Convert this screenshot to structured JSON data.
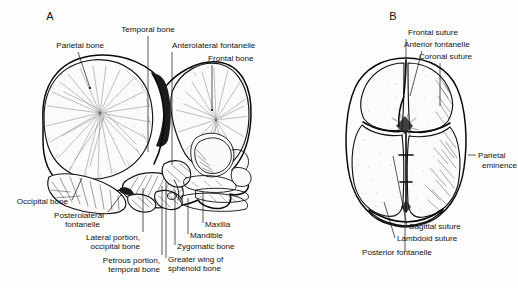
{
  "figure": {
    "background": "#fdfdfd",
    "ink": "#111111"
  },
  "panels": [
    {
      "id": "A",
      "letter": "A",
      "view": "lateral",
      "letter_pos": {
        "x": 50,
        "y": 20
      },
      "labels": [
        {
          "name": "parietal-bone",
          "text": "Parietal bone",
          "text_anchor": "end",
          "x": 104,
          "y": 48,
          "leader": "M 78 52 L 90 88"
        },
        {
          "name": "temporal-bone",
          "text": "Temporal bone",
          "text_anchor": "middle",
          "x": 148,
          "y": 32,
          "leader": "M 148 36 L 148 152"
        },
        {
          "name": "anterolateral-fontanelle",
          "text": "Anterolateral fontanelle",
          "text_anchor": "start",
          "x": 172,
          "y": 48,
          "leader": "M 172 52 L 172 165"
        },
        {
          "name": "frontal-bone",
          "text": "Frontal bone",
          "text_anchor": "start",
          "x": 208,
          "y": 61,
          "leader": "M 212 65 L 212 110"
        },
        {
          "name": "occipital-bone",
          "text": "Occipital bone",
          "text_anchor": "end",
          "x": 68,
          "y": 204,
          "leader": "M 72 200 L 82 178"
        },
        {
          "name": "posterolateral-fontanelle",
          "text": "Posterolateral",
          "text2": "fontanelle",
          "text_anchor": "end",
          "x": 104,
          "y": 218,
          "leader": "M 108 212 L 121 195"
        },
        {
          "name": "lateral-portion-occipital-bone",
          "text": "Lateral portion,",
          "text2": "occipital bone",
          "text_anchor": "end",
          "x": 140,
          "y": 240,
          "leader": "M 143 232 L 143 188"
        },
        {
          "name": "petrous-portion-temporal-bone",
          "text": "Petrous portion,",
          "text2": "temporal bone",
          "text_anchor": "end",
          "x": 160,
          "y": 263,
          "leader": "M 162 255 L 162 186"
        },
        {
          "name": "maxilla",
          "text": "Maxilla",
          "text_anchor": "start",
          "x": 205,
          "y": 227,
          "leader": "M 203 223 L 203 192"
        },
        {
          "name": "mandible",
          "text": "Mandible",
          "text_anchor": "start",
          "x": 190,
          "y": 238,
          "leader": "M 188 234 L 188 196"
        },
        {
          "name": "zygomatic-bone",
          "text": "Zygomatic bone",
          "text_anchor": "start",
          "x": 177,
          "y": 249,
          "leader": "M 175 245 L 175 190"
        },
        {
          "name": "greater-wing-of-sphenoid-bone",
          "text": "Greater wing of",
          "text2": "sphenoid bone",
          "text_anchor": "start",
          "x": 168,
          "y": 262,
          "leader": "M 166 258 L 166 182"
        }
      ]
    },
    {
      "id": "B",
      "letter": "B",
      "view": "superior",
      "letter_pos": {
        "x": 393,
        "y": 20
      },
      "labels": [
        {
          "name": "frontal-suture",
          "text": "Frontal suture",
          "text_anchor": "middle",
          "x": 433,
          "y": 35,
          "leader": "M 406 39 L 406 66"
        },
        {
          "name": "anterior-fontanelle",
          "text": "Anterior fontanelle",
          "text_anchor": "start",
          "x": 404,
          "y": 47,
          "leader": "M 422 51 L 410 95"
        },
        {
          "name": "coronal-suture",
          "text": "Coronal suture",
          "text_anchor": "start",
          "x": 419,
          "y": 59,
          "leader": "M 440 63 L 440 106"
        },
        {
          "name": "parietal-eminence",
          "text": "Parietal",
          "text2": "eminence",
          "text_anchor": "start",
          "x": 477,
          "y": 158,
          "leader": "M 469 155 L 476 155"
        },
        {
          "name": "sagittal-suture",
          "text": "Sagittal suture",
          "text_anchor": "start",
          "x": 409,
          "y": 229,
          "leader": "M 407 226 L 393 155"
        },
        {
          "name": "lambdoid-suture",
          "text": "Lambdoid suture",
          "text_anchor": "start",
          "x": 397,
          "y": 241,
          "leader": "M 395 238 L 383 201"
        },
        {
          "name": "posterior-fontanelle",
          "text": "Posterior fontanelle",
          "text_anchor": "start",
          "x": 362,
          "y": 255,
          "leader": "M 405 252 L 405 205"
        }
      ]
    }
  ]
}
